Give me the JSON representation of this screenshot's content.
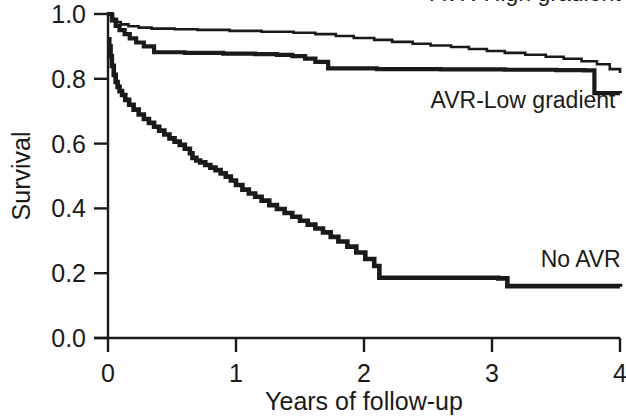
{
  "chart_data": {
    "type": "line",
    "title": "",
    "subtitle": "",
    "xlabel": "Years of follow-up",
    "ylabel": "Survival",
    "xlim": [
      0,
      4
    ],
    "ylim": [
      0.0,
      1.0
    ],
    "grid": false,
    "legend_position": "inline-right",
    "x_ticks": [
      0,
      1,
      2,
      3,
      4
    ],
    "x_tick_labels": [
      "0",
      "1",
      "2",
      "3",
      "4"
    ],
    "y_ticks": [
      0.0,
      0.2,
      0.4,
      0.6,
      0.8,
      1.0
    ],
    "y_tick_labels": [
      "0.0",
      "0.2",
      "0.4",
      "0.6",
      "0.8",
      "1.0"
    ],
    "series": [
      {
        "name": "AVR-High gradient",
        "label": "AVR-High gradient",
        "color": "#1a1a1a",
        "line_width": 2.6,
        "step": "post",
        "x": [
          0.0,
          0.04,
          0.07,
          0.1,
          0.16,
          0.24,
          0.34,
          0.52,
          0.7,
          0.95,
          1.2,
          1.45,
          1.62,
          1.78,
          1.92,
          2.08,
          2.22,
          2.38,
          2.52,
          2.68,
          2.82,
          2.96,
          3.1,
          3.26,
          3.42,
          3.56,
          3.7,
          3.82,
          3.92,
          4.0
        ],
        "y": [
          1.0,
          0.985,
          0.975,
          0.968,
          0.962,
          0.958,
          0.955,
          0.953,
          0.951,
          0.948,
          0.945,
          0.942,
          0.938,
          0.932,
          0.926,
          0.92,
          0.914,
          0.908,
          0.903,
          0.898,
          0.892,
          0.886,
          0.88,
          0.874,
          0.868,
          0.862,
          0.854,
          0.845,
          0.83,
          0.818
        ]
      },
      {
        "name": "AVR-Low gradient",
        "label": "AVR-Low gradient",
        "color": "#1a1a1a",
        "line_width": 4.2,
        "step": "post",
        "x": [
          0.0,
          0.03,
          0.06,
          0.09,
          0.13,
          0.17,
          0.22,
          0.28,
          0.36,
          0.6,
          0.9,
          1.15,
          1.32,
          1.44,
          1.54,
          1.62,
          1.72,
          2.1,
          2.6,
          3.1,
          3.5,
          3.72,
          3.8,
          4.0
        ],
        "y": [
          1.0,
          0.98,
          0.963,
          0.95,
          0.938,
          0.925,
          0.912,
          0.9,
          0.882,
          0.88,
          0.878,
          0.876,
          0.874,
          0.87,
          0.862,
          0.852,
          0.832,
          0.83,
          0.829,
          0.828,
          0.827,
          0.826,
          0.756,
          0.755
        ]
      },
      {
        "name": "No AVR",
        "label": "No AVR",
        "color": "#1a1a1a",
        "line_width": 4.6,
        "step": "post",
        "x": [
          0.0,
          0.01,
          0.02,
          0.03,
          0.045,
          0.06,
          0.075,
          0.09,
          0.11,
          0.135,
          0.165,
          0.2,
          0.24,
          0.28,
          0.32,
          0.36,
          0.4,
          0.44,
          0.48,
          0.52,
          0.56,
          0.6,
          0.64,
          0.66,
          0.69,
          0.72,
          0.76,
          0.8,
          0.84,
          0.88,
          0.92,
          0.96,
          1.0,
          1.05,
          1.1,
          1.15,
          1.2,
          1.26,
          1.32,
          1.38,
          1.44,
          1.5,
          1.56,
          1.62,
          1.68,
          1.74,
          1.8,
          1.87,
          1.94,
          2.01,
          2.08,
          2.12,
          3.05,
          3.12,
          4.0
        ],
        "y": [
          0.922,
          0.9,
          0.87,
          0.84,
          0.812,
          0.79,
          0.775,
          0.762,
          0.75,
          0.735,
          0.72,
          0.705,
          0.69,
          0.676,
          0.664,
          0.652,
          0.64,
          0.628,
          0.616,
          0.606,
          0.596,
          0.584,
          0.57,
          0.556,
          0.548,
          0.542,
          0.534,
          0.526,
          0.518,
          0.508,
          0.498,
          0.486,
          0.472,
          0.458,
          0.446,
          0.436,
          0.424,
          0.41,
          0.398,
          0.386,
          0.374,
          0.362,
          0.35,
          0.338,
          0.326,
          0.312,
          0.298,
          0.282,
          0.264,
          0.244,
          0.222,
          0.186,
          0.184,
          0.16,
          0.158
        ]
      }
    ],
    "annotations": [
      {
        "text": "AVR-High gradient",
        "x": 2.52,
        "y": 1.065,
        "anchor": "start"
      },
      {
        "text": "AVR-Low gradient",
        "x": 2.52,
        "y": 0.735,
        "anchor": "start"
      },
      {
        "text": "No AVR",
        "x": 3.38,
        "y": 0.245,
        "anchor": "start"
      }
    ]
  },
  "axes": {
    "y_title": "Survival",
    "x_title": "Years of follow-up"
  }
}
